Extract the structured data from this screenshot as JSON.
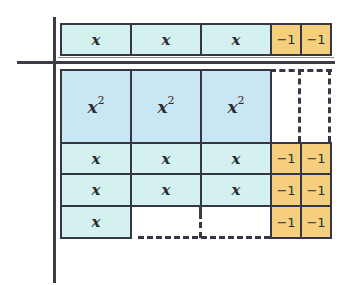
{
  "diagram": {
    "type": "algebra-tiles-factoring",
    "colors": {
      "x_tile": "#d4f1ef",
      "x2_tile": "#c8e6f3",
      "neg1_tile": "#f6cf7e",
      "line": "#353844"
    },
    "top_factor": {
      "tiles": [
        "x",
        "x",
        "x",
        "−1",
        "−1"
      ],
      "expression": "3x − 2"
    },
    "left_factor": {
      "tiles": []
    },
    "grid": {
      "rows": [
        {
          "cells": [
            "x2",
            "x2",
            "x2",
            "empty",
            "empty"
          ]
        },
        {
          "cells": [
            "x",
            "x",
            "x",
            "-1",
            "-1"
          ]
        },
        {
          "cells": [
            "x",
            "x",
            "x",
            "-1",
            "-1"
          ]
        },
        {
          "cells": [
            "x",
            "empty",
            "empty",
            "-1",
            "-1"
          ]
        }
      ]
    },
    "labels": {
      "x": "x",
      "x2_base": "x",
      "x2_exp": "2",
      "neg1": "−1"
    }
  }
}
